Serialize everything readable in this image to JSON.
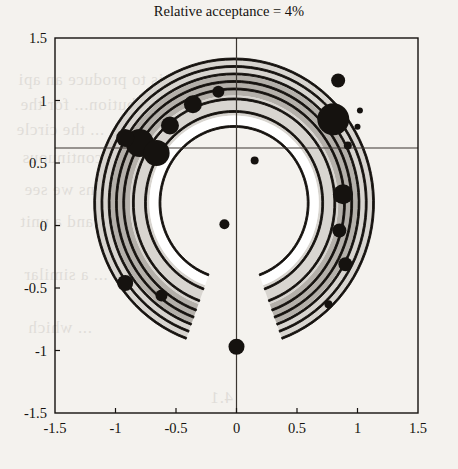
{
  "figure": {
    "title": "Relative acceptance = 4%",
    "background_color": "#f4f2ee",
    "ink_color": "#15120f"
  },
  "chart_data": {
    "type": "scatter",
    "title": "Relative acceptance = 4%",
    "xlabel": "",
    "ylabel": "",
    "xlim": [
      -1.5,
      1.5
    ],
    "ylim": [
      -1.5,
      1.5
    ],
    "grid": false,
    "legend": null,
    "xticks": [
      "-1.5",
      "-1",
      "-0.5",
      "0",
      "0.5",
      "1",
      "1.5"
    ],
    "xtick_values": [
      -1.5,
      -1,
      -0.5,
      0,
      0.5,
      1,
      1.5
    ],
    "yticks": [
      "1.5",
      "1",
      "0.5",
      "0",
      "-0.5",
      "-1",
      "-1.5"
    ],
    "ytick_values": [
      1.5,
      1,
      0.5,
      0,
      -0.5,
      -1,
      -1.5
    ],
    "crosshair": {
      "vertical_x": 0.0,
      "horizontal_y": 0.62,
      "color": "#3a3530"
    },
    "contours": {
      "shape": "crescent-annulus",
      "description": "Nested closed contour levels forming a C-shaped ring open at the bottom, centered near the origin, with shaded bands between levels.",
      "center": [
        -0.02,
        0.18
      ],
      "outer_radius": 1.16,
      "inner_radius": 0.62,
      "gap_angle_deg": [
        250,
        290
      ],
      "levels": [
        1,
        2,
        3,
        4,
        5,
        6,
        7
      ],
      "fill_colors": [
        "#ffffff",
        "#d8d5d0",
        "#b4b0aa",
        "#d8d5d0"
      ],
      "line_color": "#15120f"
    },
    "scatter": {
      "marker": "filled-circle",
      "color": "#15120f",
      "points": [
        {
          "x": -0.8,
          "y": 0.66,
          "r": 14
        },
        {
          "x": -0.66,
          "y": 0.58,
          "r": 13
        },
        {
          "x": -0.55,
          "y": 0.8,
          "r": 9
        },
        {
          "x": -0.92,
          "y": 0.7,
          "r": 9
        },
        {
          "x": -0.36,
          "y": 0.97,
          "r": 9
        },
        {
          "x": -0.15,
          "y": 1.07,
          "r": 6
        },
        {
          "x": 0.8,
          "y": 0.85,
          "r": 16
        },
        {
          "x": 0.84,
          "y": 1.16,
          "r": 7
        },
        {
          "x": 1.02,
          "y": 0.92,
          "r": 3
        },
        {
          "x": 1.0,
          "y": 0.79,
          "r": 3
        },
        {
          "x": 0.92,
          "y": 0.64,
          "r": 4
        },
        {
          "x": 0.88,
          "y": 0.25,
          "r": 10
        },
        {
          "x": 0.85,
          "y": -0.04,
          "r": 7
        },
        {
          "x": 0.9,
          "y": -0.31,
          "r": 7
        },
        {
          "x": 0.76,
          "y": -0.63,
          "r": 4
        },
        {
          "x": -0.92,
          "y": -0.46,
          "r": 8
        },
        {
          "x": -0.62,
          "y": -0.56,
          "r": 6
        },
        {
          "x": 0.15,
          "y": 0.52,
          "r": 4
        },
        {
          "x": -0.1,
          "y": 0.01,
          "r": 5
        },
        {
          "x": 0.0,
          "y": -0.97,
          "r": 8
        }
      ]
    }
  },
  "paper_bleed": [
    {
      "text": "...cem is to produce an api",
      "x": 18,
      "y": 70
    },
    {
      "text": "distribution... for the",
      "x": 20,
      "y": 95
    },
    {
      "text": "... the circle",
      "x": 16,
      "y": 120
    },
    {
      "text": "...ing continuous",
      "x": 22,
      "y": 148
    },
    {
      "text": "... regions we see",
      "x": 24,
      "y": 180
    },
    {
      "text": "...des and a unit",
      "x": 20,
      "y": 212
    },
    {
      "text": "... a similar",
      "x": 24,
      "y": 265
    },
    {
      "text": "... which",
      "x": 28,
      "y": 318
    },
    {
      "text": "4.1",
      "x": 210,
      "y": 388
    }
  ]
}
